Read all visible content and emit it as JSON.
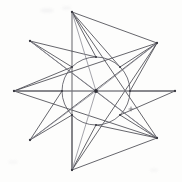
{
  "figure": {
    "background_color": "#fdfdfc",
    "line_color": "#4a4a52",
    "faint_line_color": "#8d8d95",
    "circle_color": "#5a5a62",
    "node_color": "#3a3a42",
    "width": 182,
    "height": 182
  },
  "chart_data": {
    "type": "scatter",
    "subtitle": "",
    "xlabel": "",
    "ylabel": "",
    "xlim": [
      0,
      182
    ],
    "ylim": [
      0,
      182
    ],
    "grid": false,
    "legend": "none",
    "center": {
      "name": "center",
      "x": 96,
      "y": 91
    },
    "circle": {
      "cx": 96,
      "cy": 91,
      "r": 34
    },
    "outer_points": [
      {
        "name": "top",
        "x": 72,
        "y": 12
      },
      {
        "name": "upper-right",
        "x": 157,
        "y": 43
      },
      {
        "name": "right",
        "x": 175,
        "y": 91
      },
      {
        "name": "lower-right",
        "x": 157,
        "y": 138
      },
      {
        "name": "bottom",
        "x": 72,
        "y": 170
      },
      {
        "name": "lower-left",
        "x": 30,
        "y": 140
      },
      {
        "name": "left",
        "x": 14,
        "y": 91
      },
      {
        "name": "upper-left",
        "x": 30,
        "y": 41
      }
    ],
    "inner_points": [
      {
        "name": "inner-n",
        "x": 96,
        "y": 57
      },
      {
        "name": "inner-ne",
        "x": 120,
        "y": 67
      },
      {
        "name": "inner-e",
        "x": 130,
        "y": 91
      },
      {
        "name": "inner-se",
        "x": 120,
        "y": 115
      },
      {
        "name": "inner-s",
        "x": 96,
        "y": 125
      },
      {
        "name": "inner-sw",
        "x": 72,
        "y": 115
      },
      {
        "name": "inner-w",
        "x": 62,
        "y": 91
      },
      {
        "name": "inner-nw",
        "x": 72,
        "y": 67
      }
    ],
    "spokes": [
      {
        "from": "center",
        "to": "top"
      },
      {
        "from": "center",
        "to": "upper-right"
      },
      {
        "from": "center",
        "to": "right"
      },
      {
        "from": "center",
        "to": "lower-right"
      },
      {
        "from": "center",
        "to": "bottom"
      },
      {
        "from": "center",
        "to": "lower-left"
      },
      {
        "from": "center",
        "to": "left"
      },
      {
        "from": "center",
        "to": "upper-left"
      }
    ],
    "star_chords": [
      {
        "from": "top",
        "to": "inner-ne"
      },
      {
        "from": "inner-ne",
        "to": "upper-right"
      },
      {
        "from": "upper-right",
        "to": "inner-e"
      },
      {
        "from": "inner-e",
        "to": "right"
      },
      {
        "from": "right",
        "to": "inner-se"
      },
      {
        "from": "inner-se",
        "to": "lower-right"
      },
      {
        "from": "lower-right",
        "to": "inner-s"
      },
      {
        "from": "inner-s",
        "to": "bottom"
      },
      {
        "from": "bottom",
        "to": "inner-sw"
      },
      {
        "from": "inner-sw",
        "to": "lower-left"
      },
      {
        "from": "lower-left",
        "to": "inner-w"
      },
      {
        "from": "inner-w",
        "to": "left"
      },
      {
        "from": "left",
        "to": "inner-nw"
      },
      {
        "from": "inner-nw",
        "to": "upper-left"
      },
      {
        "from": "upper-left",
        "to": "inner-n"
      },
      {
        "from": "inner-n",
        "to": "top"
      }
    ],
    "long_chords": [
      {
        "from": "top",
        "to": "bottom"
      },
      {
        "from": "left",
        "to": "right"
      },
      {
        "from": "upper-left",
        "to": "lower-right"
      },
      {
        "from": "upper-right",
        "to": "lower-left"
      },
      {
        "from": "top",
        "to": "lower-right"
      },
      {
        "from": "top",
        "to": "upper-right"
      },
      {
        "from": "bottom",
        "to": "upper-right"
      },
      {
        "from": "bottom",
        "to": "lower-right"
      },
      {
        "from": "left",
        "to": "upper-right"
      },
      {
        "from": "left",
        "to": "lower-right"
      }
    ],
    "annotations": [
      {
        "name": "cross-mark",
        "symbol": "+",
        "x": 131,
        "y": 109
      }
    ]
  }
}
